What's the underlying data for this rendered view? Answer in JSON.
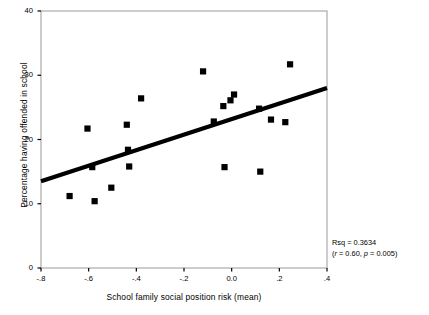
{
  "figure": {
    "top_cut_text": "",
    "background": "#ffffff",
    "marker_color": "#000000",
    "line_color": "#000000",
    "frame_color": "#9a9a9a"
  },
  "axes": {
    "y_title": "Percentage having offended in school",
    "x_title": "School family social position risk (mean)",
    "y_ticks": [
      "0",
      "10",
      "20",
      "30",
      "40"
    ],
    "x_ticks": [
      "-.8",
      "-.6",
      "-.4",
      "-.2",
      "0.0",
      ".2",
      ".4"
    ]
  },
  "annotation": {
    "rsq": "Rsq = 0.3634",
    "stats_prefix": "(",
    "stats_r_sym": "r",
    "stats_r_val": " = 0.60, ",
    "stats_p_sym": "p",
    "stats_p_val": " = 0.005)"
  },
  "chart_data": {
    "type": "scatter",
    "title": "",
    "xlabel": "School family social position risk (mean)",
    "ylabel": "Percentage having offended in school",
    "xlim": [
      -0.8,
      0.4
    ],
    "ylim": [
      0,
      40
    ],
    "xticks": [
      -0.8,
      -0.6,
      -0.4,
      -0.2,
      0.0,
      0.2,
      0.4
    ],
    "yticks": [
      0,
      10,
      20,
      30,
      40
    ],
    "xticklabels": [
      "-.8",
      "-.6",
      "-.4",
      "-.2",
      "0.0",
      ".2",
      ".4"
    ],
    "yticklabels": [
      "0",
      "10",
      "20",
      "30",
      "40"
    ],
    "grid": false,
    "legend": false,
    "marker": "square",
    "points": [
      {
        "x": -0.68,
        "y": 11.2
      },
      {
        "x": -0.605,
        "y": 21.7
      },
      {
        "x": -0.585,
        "y": 15.7
      },
      {
        "x": -0.575,
        "y": 10.4
      },
      {
        "x": -0.505,
        "y": 12.5
      },
      {
        "x": -0.44,
        "y": 22.3
      },
      {
        "x": -0.435,
        "y": 18.4
      },
      {
        "x": -0.43,
        "y": 15.8
      },
      {
        "x": -0.38,
        "y": 26.4
      },
      {
        "x": -0.12,
        "y": 30.6
      },
      {
        "x": -0.075,
        "y": 22.8
      },
      {
        "x": -0.035,
        "y": 25.2
      },
      {
        "x": -0.03,
        "y": 15.7
      },
      {
        "x": -0.005,
        "y": 26.1
      },
      {
        "x": 0.01,
        "y": 27.0
      },
      {
        "x": 0.115,
        "y": 24.8
      },
      {
        "x": 0.12,
        "y": 15.0
      },
      {
        "x": 0.165,
        "y": 23.1
      },
      {
        "x": 0.225,
        "y": 22.7
      },
      {
        "x": 0.245,
        "y": 31.7
      }
    ],
    "fit_line": {
      "type": "linear",
      "x_start": -0.8,
      "y_start": 13.5,
      "x_end": 0.4,
      "y_end": 28.0,
      "slope": 12.08,
      "intercept": 23.17
    },
    "statistics": {
      "rsq": 0.3634,
      "r": 0.6,
      "p": 0.005,
      "n": 20
    }
  }
}
